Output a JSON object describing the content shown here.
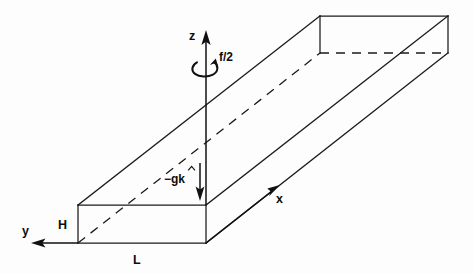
{
  "figure": {
    "type": "line-diagram",
    "background_color": "#ffffff",
    "line_color": "#111111",
    "labels": {
      "z_axis": "z",
      "x_axis": "x",
      "y_axis": "y",
      "rotation": "f/2",
      "gravity": "−g",
      "gravity_unit_vector": "k",
      "gravity_hat": "̂",
      "height": "H",
      "length": "L"
    },
    "geometry": {
      "front_face": {
        "top_left": [
          78,
          205
        ],
        "top_right": [
          206,
          205
        ],
        "bottom_right": [
          206,
          243
        ],
        "bottom_left": [
          78,
          243
        ]
      },
      "far_face": {
        "top_left": [
          320,
          16
        ],
        "top_right": [
          448,
          16
        ],
        "bottom_right": [
          448,
          53
        ],
        "bottom_left": [
          320,
          53
        ]
      },
      "depth_offset": [
        242,
        -189
      ]
    },
    "axes": {
      "z": {
        "from": [
          206,
          205
        ],
        "to": [
          206,
          33
        ],
        "direction": "up"
      },
      "x": {
        "from": [
          206,
          243
        ],
        "to": [
          279,
          186
        ],
        "direction": "up-right"
      },
      "y": {
        "from": [
          78,
          243
        ],
        "to": [
          33,
          243
        ],
        "direction": "left"
      },
      "gravity": {
        "from": [
          200,
          165
        ],
        "to": [
          200,
          200
        ],
        "direction": "down"
      }
    },
    "dimension_marks": {
      "H": {
        "position": [
          62,
          214
        ],
        "spans": "front face vertical height"
      },
      "L": {
        "position": [
          137,
          261
        ],
        "spans": "front face horizontal width"
      }
    }
  }
}
